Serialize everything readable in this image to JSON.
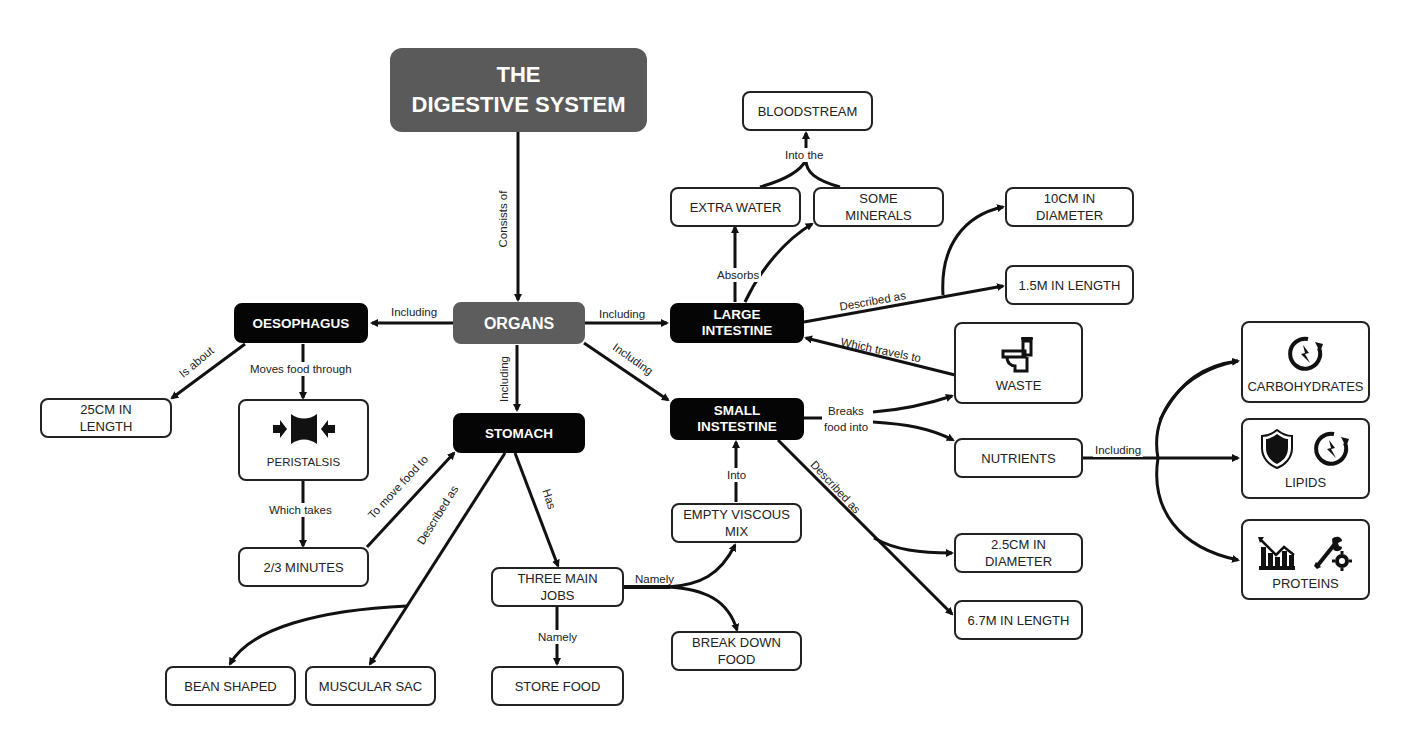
{
  "title": {
    "line1": "THE",
    "line2": "DIGESTIVE SYSTEM"
  },
  "nodes": {
    "organs": "ORGANS",
    "oesophagus": "OESOPHAGUS",
    "stomach": "STOMACH",
    "large_intestine": {
      "line1": "LARGE",
      "line2": "INTESTINE"
    },
    "small_intestine": {
      "line1": "SMALL",
      "line2": "INSTESTINE"
    },
    "oes_length": {
      "line1": "25CM IN",
      "line2": "LENGTH"
    },
    "peristalsis": "PERISTALSIS",
    "minutes": "2/3 MINUTES",
    "bean_shaped": "BEAN SHAPED",
    "muscular_sac": "MUSCULAR SAC",
    "three_jobs": {
      "line1": "THREE MAIN",
      "line2": "JOBS"
    },
    "store_food": "STORE FOOD",
    "empty_mix": {
      "line1": "EMPTY VISCOUS",
      "line2": "MIX"
    },
    "break_down": {
      "line1": "BREAK DOWN",
      "line2": "FOOD"
    },
    "bloodstream": "BLOODSTREAM",
    "extra_water": "EXTRA WATER",
    "some_minerals": {
      "line1": "SOME",
      "line2": "MINERALS"
    },
    "li_diameter": {
      "line1": "10CM IN",
      "line2": "DIAMETER"
    },
    "li_length": "1.5M IN LENGTH",
    "waste": "WASTE",
    "nutrients": "NUTRIENTS",
    "si_diameter": {
      "line1": "2.5CM IN",
      "line2": "DIAMETER"
    },
    "si_length": "6.7M IN LENGTH",
    "carbohydrates": "CARBOHYDRATES",
    "lipids": "LIPIDS",
    "proteins": "PROTEINS"
  },
  "labels": {
    "consists_of": "Consists of",
    "including_left": "Including",
    "including_right": "Including",
    "including_down": "Including",
    "including_diag": "Including",
    "is_about": "Is about",
    "moves_food_through": "Moves food through",
    "which_takes": "Which takes",
    "to_move_food_to": "To move food to",
    "described_as_stomach": "Described as",
    "has": "Has",
    "namely_right": "Namely",
    "namely_down": "Namely",
    "into": "Into",
    "absorbs": "Absorbs",
    "into_the": "Into the",
    "described_as_li": "Described as",
    "which_travels_to": "Which travels to",
    "breaks_food_into_1": "Breaks",
    "breaks_food_into_2": "food into",
    "described_as_si": "Described as",
    "including_nutrients": "Including"
  },
  "icons": {
    "peristalsis": "peristalsis-icon",
    "waste": "toilet-icon",
    "carbohydrates": "energy-cycle-icon",
    "lipids_1": "shield-icon",
    "lipids_2": "energy-cycle-icon",
    "proteins_1": "growth-chart-icon",
    "proteins_2": "wrench-gear-icon"
  },
  "colors": {
    "dark_node": "#050505",
    "grey_node": "#5d5d5d",
    "title_node": "#5a5a5a",
    "line": "#111111"
  }
}
